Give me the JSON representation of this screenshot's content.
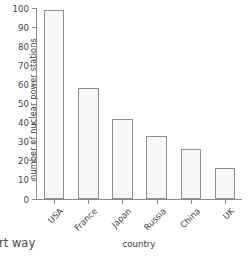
{
  "chart_data": {
    "type": "bar",
    "title": "",
    "xlabel": "country",
    "ylabel": "number of nuclear power stations",
    "categories": [
      "USA",
      "France",
      "Japan",
      "Russia",
      "China",
      "UK"
    ],
    "values": [
      99,
      58,
      42,
      33,
      26,
      16
    ],
    "ylim": [
      0,
      100
    ],
    "yticks": [
      0,
      10,
      20,
      30,
      40,
      50,
      60,
      70,
      80,
      90,
      100
    ],
    "ytick_labels": [
      "0",
      "10",
      "20",
      "30",
      "40",
      "50",
      "60",
      "70",
      "80",
      "90",
      "100"
    ],
    "grid": false,
    "legend": "none",
    "bar_fill": "#f7f7f7",
    "bar_edge": "#8e8e8e",
    "axis_color": "#8a8a8a",
    "xtick_rotation": -45
  },
  "caption": {
    "fragment": "art way"
  }
}
